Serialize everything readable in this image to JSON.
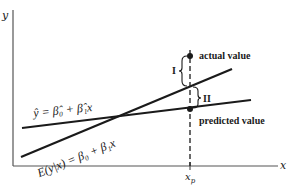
{
  "diagram": {
    "axes": {
      "y_label": "y",
      "x_label": "x",
      "x_tick_label": "x",
      "x_tick_subscript": "p"
    },
    "lines": [
      {
        "name": "fitted-line",
        "label": "ŷ = β̂₀ + β̂₁x",
        "x0": 22,
        "y0": 128,
        "x1": 251,
        "y1": 100
      },
      {
        "name": "true-mean-line",
        "label": "E(y|x) = β₀ + β₁x",
        "x0": 21,
        "y0": 157,
        "x1": 232,
        "y1": 69
      }
    ],
    "points": {
      "actual": {
        "label": "actual value",
        "x": 190,
        "y": 56
      },
      "predicted": {
        "label": "predicted value",
        "x": 190,
        "y": 109
      }
    },
    "braces": {
      "I": {
        "label": "I"
      },
      "II": {
        "label": "II"
      }
    }
  }
}
